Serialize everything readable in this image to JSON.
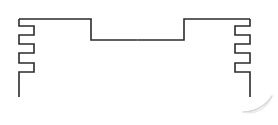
{
  "document": {
    "title": "Technical Outline Drawing",
    "kind": "line-drawing",
    "background_color": "#ffffff",
    "stroke_color": "#2b2b2b",
    "stroke_width": 1.6,
    "canvas": {
      "width": 278,
      "height": 125
    }
  },
  "drawing": {
    "description": "Symmetric open profile outline: flat top rail stepping down to a recessed center section, with three castellated notches cut into each of the left and right vertical edges, open at the bottom.",
    "outline_points": "19,19 91,19 91,40 184,40 184,19 250,19 250,26 235,26 235,35 250,35 250,44 235,44 235,53 250,53 250,63 235,63 235,72 250,72 250,97 250,97 M19,19 19,26 34,26 34,35 19,35 19,44 34,44 34,53 19,53 19,63 34,63 34,72 19,72 19,97",
    "left_edge_x": 19,
    "right_edge_x": 250,
    "top_edge_y": 19,
    "center_step_y": 40,
    "bottom_open_y": 97,
    "center_step_left_x": 91,
    "center_step_right_x": 184,
    "notch_depth": 15,
    "notch_count_per_side": 3
  },
  "annotations": {
    "smudge": {
      "name": "pencil-arc-smudge",
      "color": "#d8d8d8",
      "location": "bottom-right",
      "path": "M243,112 C255,112 266,106 272,96"
    }
  }
}
